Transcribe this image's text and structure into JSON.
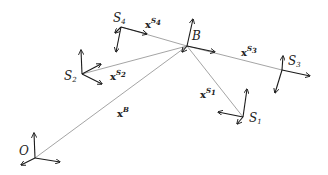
{
  "diagram": {
    "type": "coordinate-frames",
    "colors": {
      "axis": "#1a1a1a",
      "vector": "#9a9a9a",
      "text": "#222222"
    },
    "frames": [
      {
        "id": "O",
        "label": "O",
        "sub": "",
        "origin": [
          35,
          158
        ]
      },
      {
        "id": "B",
        "label": "B",
        "sub": "",
        "origin": [
          187,
          46
        ]
      },
      {
        "id": "S1",
        "label": "S",
        "sub": "1",
        "origin": [
          243,
          117
        ]
      },
      {
        "id": "S2",
        "label": "S",
        "sub": "2",
        "origin": [
          82,
          74
        ]
      },
      {
        "id": "S3",
        "label": "S",
        "sub": "3",
        "origin": [
          282,
          70
        ]
      },
      {
        "id": "S4",
        "label": "S",
        "sub": "4",
        "origin": [
          121,
          27
        ]
      }
    ],
    "vectors": [
      {
        "id": "xB",
        "label": "x",
        "sup": "B",
        "sup_sub": "",
        "from": "O",
        "to": "B"
      },
      {
        "id": "xS1",
        "label": "x",
        "sup": "S",
        "sup_sub": "1",
        "from": "B",
        "to": "S1"
      },
      {
        "id": "xS2",
        "label": "x",
        "sup": "S",
        "sup_sub": "2",
        "from": "B",
        "to": "S2"
      },
      {
        "id": "xS3",
        "label": "x",
        "sup": "S",
        "sup_sub": "3",
        "from": "B",
        "to": "S3"
      },
      {
        "id": "xS4",
        "label": "x",
        "sup": "S",
        "sup_sub": "4",
        "from": "B",
        "to": "S4"
      }
    ]
  }
}
